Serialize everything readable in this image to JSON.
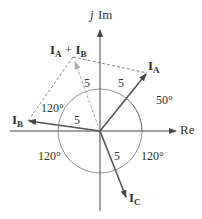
{
  "axes": {
    "imag_label_j": "j",
    "imag_label": "Im",
    "real_label": "Re"
  },
  "phasors": {
    "IA": {
      "label": "I",
      "sub": "A",
      "magnitude": "5",
      "angle_label": "50°"
    },
    "IB": {
      "label": "I",
      "sub": "B",
      "magnitude": "5",
      "angle_label": "120°"
    },
    "IC": {
      "label": "I",
      "sub": "C",
      "magnitude": "5"
    },
    "sum": {
      "label1": "I",
      "sub1": "A",
      "plus": " + ",
      "label2": "I",
      "sub2": "B",
      "magnitude": "5"
    }
  },
  "angles": {
    "left_lower": "120°",
    "right_lower": "120°"
  },
  "colors": {
    "axis": "#444444",
    "phasor": "#555555",
    "dashed": "#666666",
    "sum_phasor": "#aaaaaa",
    "circle": "#777777"
  }
}
